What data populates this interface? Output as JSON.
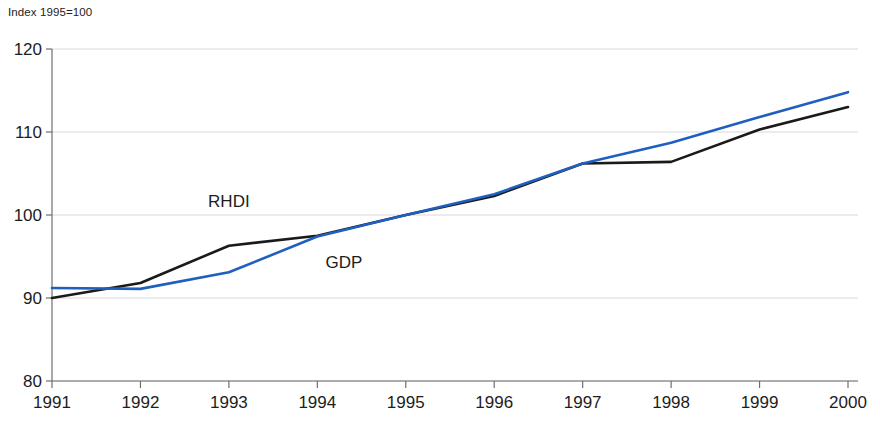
{
  "chart_data": {
    "type": "line",
    "title": "",
    "subtitle": "",
    "axis_note": "Index 1995=100",
    "xlabel": "",
    "ylabel": "",
    "x": [
      1991,
      1992,
      1993,
      1994,
      1995,
      1996,
      1997,
      1998,
      1999,
      2000
    ],
    "xticklabels": [
      "1991",
      "1992",
      "1993",
      "1994",
      "1995",
      "1996",
      "1997",
      "1998",
      "1999",
      "2000"
    ],
    "yticks": [
      80,
      90,
      100,
      110,
      120
    ],
    "yticklabels": [
      "80",
      "90",
      "100",
      "110",
      "120"
    ],
    "ylim": [
      80,
      120
    ],
    "xlim": [
      1991,
      2000
    ],
    "grid": "horizontal",
    "legend_position": "inline-annotations",
    "series": [
      {
        "name": "RHDI",
        "color": "#1a1a1a",
        "width": 2.6,
        "label_text": "RHDI",
        "label_x": 1993.0,
        "label_y": 101.0,
        "values": [
          90.0,
          91.8,
          96.3,
          97.5,
          100.0,
          102.3,
          106.2,
          106.4,
          110.3,
          113.0
        ]
      },
      {
        "name": "GDP",
        "color": "#1f60bf",
        "width": 2.6,
        "label_text": "GDP",
        "label_x": 1994.3,
        "label_y": 93.6,
        "values": [
          91.2,
          91.1,
          93.1,
          97.4,
          100.0,
          102.5,
          106.2,
          108.7,
          111.8,
          114.8
        ]
      }
    ]
  }
}
